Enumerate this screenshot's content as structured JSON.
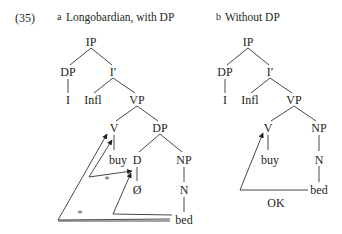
{
  "example_number": "(35)",
  "panels": [
    {
      "letter": "a",
      "title": "Longobardian, with DP",
      "nodes": {
        "ip": "IP",
        "dp_spec": "DP",
        "i_bar": "I′",
        "i_leaf": "I",
        "infl": "Infl",
        "vp": "VP",
        "v": "V",
        "dp_obj": "DP",
        "buy": "buy",
        "d": "D",
        "np": "NP",
        "null_d": "Ø",
        "n": "N",
        "bed": "bed"
      },
      "movement_marks": [
        "*",
        "*"
      ]
    },
    {
      "letter": "b",
      "title": "Without DP",
      "nodes": {
        "ip": "IP",
        "dp_spec": "DP",
        "i_bar": "I′",
        "i_leaf": "I",
        "infl": "Infl",
        "vp": "VP",
        "v": "V",
        "buy": "buy",
        "np": "NP",
        "n": "N",
        "bed": "bed"
      },
      "movement_label": "OK"
    }
  ],
  "colors": {
    "ink": "#231f20",
    "line": "#333333"
  }
}
